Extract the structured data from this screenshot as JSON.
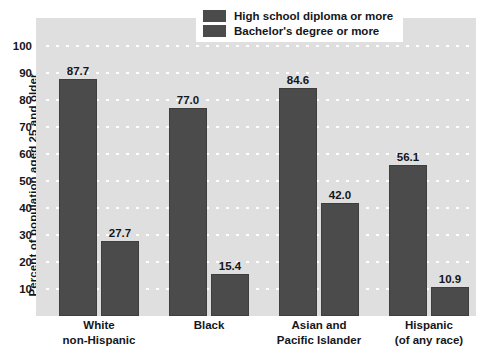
{
  "chart_data": {
    "type": "bar",
    "title": "",
    "xlabel": "",
    "ylabel": "Percent of population aged 25 and older",
    "ylim": [
      0,
      100
    ],
    "grid": true,
    "legend_position": "top-right",
    "categories": [
      {
        "line1": "White",
        "line2": "non-Hispanic"
      },
      {
        "line1": "Black",
        "line2": ""
      },
      {
        "line1": "Asian and",
        "line2": "Pacific Islander"
      },
      {
        "line1": "Hispanic",
        "line2": "(of any race)"
      }
    ],
    "y_ticks": [
      100,
      90,
      80,
      70,
      60,
      50,
      40,
      30,
      20,
      10
    ],
    "series": [
      {
        "name": "High school diploma or more",
        "values": [
          87.7,
          77.0,
          84.6,
          56.1
        ],
        "labels": [
          "87.7",
          "77.0",
          "84.6",
          "56.1"
        ],
        "color": "#4b4b4b"
      },
      {
        "name": "Bachelor's degree or more",
        "values": [
          27.7,
          15.4,
          42.0,
          10.9
        ],
        "labels": [
          "27.7",
          "15.4",
          "42.0",
          "10.9"
        ],
        "color": "#4b4b4b"
      }
    ],
    "colors": {
      "plot_background": "#dfdfdf",
      "bar": "#4b4b4b",
      "gridline": "#ffffff",
      "text": "#15161a",
      "page_background": "#ffffff"
    }
  },
  "legend": {
    "items": [
      {
        "label": "High school diploma or more"
      },
      {
        "label": "Bachelor's degree or more"
      }
    ]
  }
}
